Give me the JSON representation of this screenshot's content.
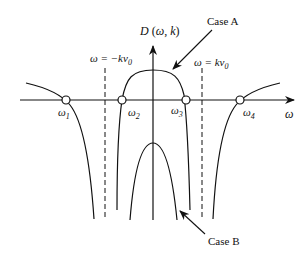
{
  "diagram": {
    "y_axis_label": "D (ω, k)",
    "x_axis_label": "ω",
    "asymptotes": [
      {
        "label": "ω = −kv₀",
        "x": 105
      },
      {
        "label": "ω = kv₀",
        "x": 202
      }
    ],
    "roots": [
      {
        "label": "ω₁",
        "x": 66
      },
      {
        "label": "ω₂",
        "x": 122
      },
      {
        "label": "ω₃",
        "x": 186
      },
      {
        "label": "ω₄",
        "x": 240
      }
    ],
    "annotations": [
      {
        "label": "Case A"
      },
      {
        "label": "Case B"
      }
    ],
    "colors": {
      "ink": "#111111",
      "background": "#ffffff"
    }
  },
  "labels": {
    "y_axis": "D (ω, k)",
    "x_axis": "ω",
    "asym_left": "ω = −kv",
    "asym_right": "ω = kv",
    "subscript_zero": "0",
    "omega": "ω",
    "root1_sub": "1",
    "root2_sub": "2",
    "root3_sub": "3",
    "root4_sub": "4",
    "case_a": "Case A",
    "case_b": "Case B"
  }
}
